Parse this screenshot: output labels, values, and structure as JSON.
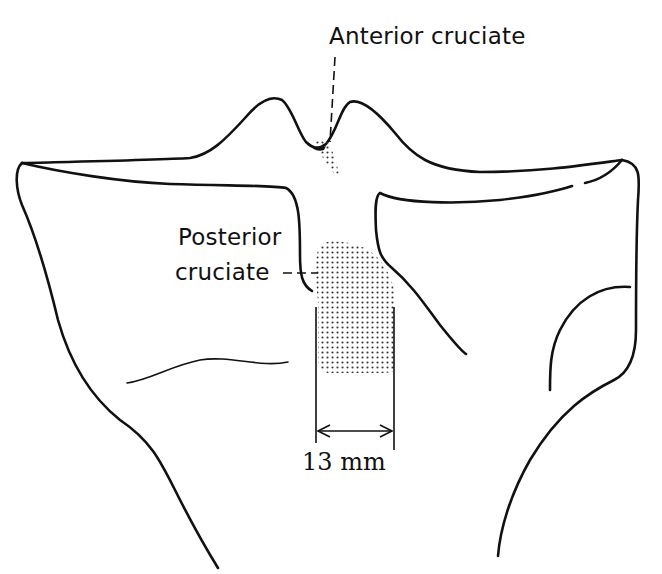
{
  "figure": {
    "type": "anatomical line drawing",
    "labels": {
      "anterior": "Anterior cruciate",
      "posterior_line1": "Posterior",
      "posterior_line2": "cruciate",
      "dimension": "13 mm"
    },
    "dimension_value": 13,
    "dimension_unit": "mm",
    "colors": {
      "line": "#111111",
      "background": "#ffffff",
      "stipple": "#333333"
    }
  }
}
